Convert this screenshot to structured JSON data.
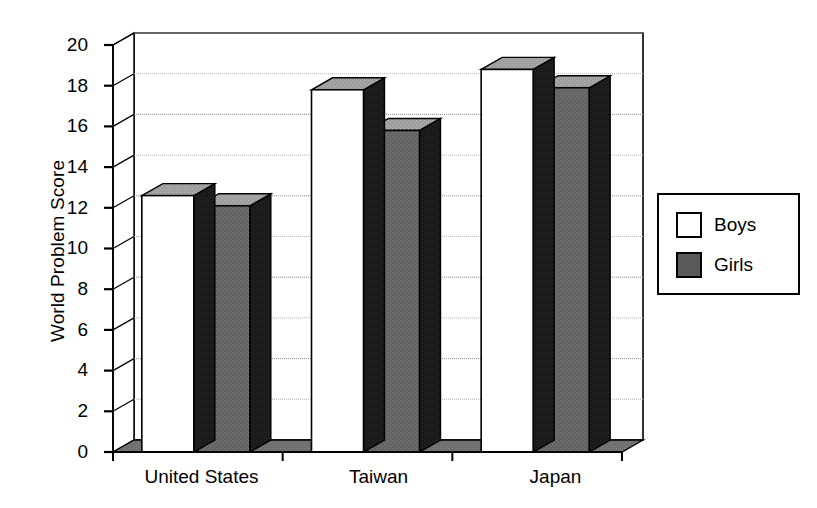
{
  "chart_data": {
    "type": "bar",
    "title": "",
    "xlabel": "",
    "ylabel": "World Problem Score",
    "categories": [
      "United States",
      "Taiwan",
      "Japan"
    ],
    "series": [
      {
        "name": "Boys",
        "values": [
          12.6,
          17.8,
          18.8
        ],
        "color": "#ffffff"
      },
      {
        "name": "Girls",
        "values": [
          12.1,
          15.8,
          17.9
        ],
        "color": "#595959"
      }
    ],
    "ylim": [
      0,
      20
    ],
    "ytick_step": 2,
    "yticks": [
      "20",
      "18",
      "16",
      "14",
      "12",
      "10",
      "8",
      "6",
      "4",
      "2",
      "0"
    ],
    "grid": true,
    "legend_position": "right",
    "style": "3d-column"
  },
  "legend": {
    "items": [
      {
        "label": "Boys",
        "swatch": "white-square-icon"
      },
      {
        "label": "Girls",
        "swatch": "gray-square-icon"
      }
    ]
  },
  "axes": {
    "y_title": "World Problem Score",
    "x_labels": [
      "United States",
      "Taiwan",
      "Japan"
    ]
  }
}
